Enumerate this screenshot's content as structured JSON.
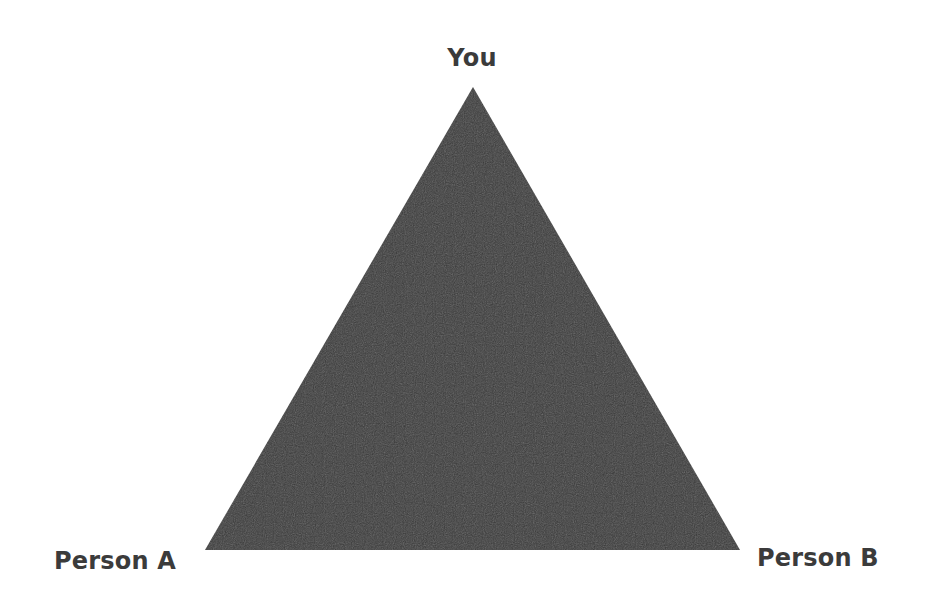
{
  "diagram": {
    "type": "triangle",
    "fill_color": "#3a3a3a",
    "label_color": "#3b3b3b",
    "background_color": "#ffffff",
    "vertices": {
      "top": {
        "label": "You",
        "x": 473,
        "y": 87
      },
      "bottom_left": {
        "label": "Person A",
        "x": 205,
        "y": 550
      },
      "bottom_right": {
        "label": "Person B",
        "x": 740,
        "y": 550
      }
    }
  }
}
